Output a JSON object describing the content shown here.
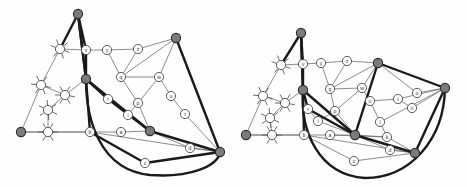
{
  "figure": {
    "title": "",
    "background": "#ffffff",
    "panel_count": 2,
    "colors": {
      "thin_edge": "#6e6e6e",
      "thick_edge": "#1a1a1a",
      "node_fill": "#ffffff",
      "node_stroke": "#4a4a4a",
      "terminal_fill": "#7b7b7b",
      "terminal_stroke": "#2a2a2a",
      "label_color": "#3a3a3a",
      "star_stroke": "#5a5a5a"
    },
    "style": {
      "node_radius": 4.6,
      "terminal_radius": 4.6,
      "thin_edge_width": 0.8,
      "thick_edge_width": 2.4,
      "star_spoke_length": 5.0,
      "label_font_size": 5.2
    }
  },
  "panels": [
    {
      "name": "left-embedding",
      "label": "",
      "nodes": [
        {
          "id": "T1",
          "label": "",
          "x": 78,
          "y": 14,
          "type": "terminal"
        },
        {
          "id": "T2",
          "label": "",
          "x": 176,
          "y": 38,
          "type": "terminal"
        },
        {
          "id": "T3",
          "label": "",
          "x": 86,
          "y": 79,
          "type": "terminal"
        },
        {
          "id": "T4",
          "label": "",
          "x": 21,
          "y": 132,
          "type": "terminal"
        },
        {
          "id": "T5",
          "label": "",
          "x": 150,
          "y": 131,
          "type": "terminal"
        },
        {
          "id": "T6",
          "label": "",
          "x": 220,
          "y": 152,
          "type": "terminal"
        },
        {
          "id": "s1",
          "label": "",
          "x": 60,
          "y": 49,
          "type": "star",
          "spokes": [
            20,
            70,
            130,
            200,
            250,
            320
          ]
        },
        {
          "id": "s2",
          "label": "",
          "x": 41,
          "y": 85,
          "type": "star",
          "spokes": [
            15,
            65,
            125,
            185,
            245,
            305
          ]
        },
        {
          "id": "s3",
          "label": "",
          "x": 65,
          "y": 95,
          "type": "star",
          "spokes": [
            10,
            60,
            120,
            180,
            240,
            300
          ]
        },
        {
          "id": "s4",
          "label": "",
          "x": 48,
          "y": 110,
          "type": "star",
          "spokes": [
            25,
            85,
            145,
            205,
            265,
            325
          ]
        },
        {
          "id": "s5",
          "label": "",
          "x": 48,
          "y": 132,
          "type": "star",
          "spokes": [
            0,
            60,
            120,
            180,
            240,
            300
          ]
        },
        {
          "id": "v",
          "label": "v",
          "x": 86,
          "y": 50,
          "type": "node"
        },
        {
          "id": "y",
          "label": "y",
          "x": 107,
          "y": 50,
          "type": "node"
        },
        {
          "id": "z",
          "label": "z",
          "x": 138,
          "y": 49,
          "type": "node"
        },
        {
          "id": "q",
          "label": "q",
          "x": 121,
          "y": 77,
          "type": "node"
        },
        {
          "id": "w",
          "label": "w",
          "x": 159,
          "y": 77,
          "type": "node"
        },
        {
          "id": "u",
          "label": "u",
          "x": 171,
          "y": 96,
          "type": "node"
        },
        {
          "id": "t",
          "label": "t",
          "x": 185,
          "y": 114,
          "type": "node"
        },
        {
          "id": "r",
          "label": "r",
          "x": 108,
          "y": 99,
          "type": "node"
        },
        {
          "id": "p",
          "label": "p",
          "x": 138,
          "y": 103,
          "type": "node"
        },
        {
          "id": "i",
          "label": "i",
          "x": 128,
          "y": 115,
          "type": "node"
        },
        {
          "id": "b",
          "label": "b",
          "x": 90,
          "y": 132,
          "type": "node"
        },
        {
          "id": "a",
          "label": "a",
          "x": 121,
          "y": 132,
          "type": "node"
        },
        {
          "id": "d",
          "label": "d",
          "x": 190,
          "y": 148,
          "type": "node"
        },
        {
          "id": "c",
          "label": "c",
          "x": 145,
          "y": 163,
          "type": "node"
        }
      ],
      "thin_edges": [
        [
          "T1",
          "s1"
        ],
        [
          "T1",
          "v"
        ],
        [
          "s1",
          "v"
        ],
        [
          "v",
          "y"
        ],
        [
          "y",
          "z"
        ],
        [
          "z",
          "T2"
        ],
        [
          "y",
          "q"
        ],
        [
          "z",
          "q"
        ],
        [
          "q",
          "T2"
        ],
        [
          "T2",
          "w"
        ],
        [
          "w",
          "u"
        ],
        [
          "u",
          "t"
        ],
        [
          "q",
          "w"
        ],
        [
          "q",
          "p"
        ],
        [
          "p",
          "w"
        ],
        [
          "s1",
          "s2"
        ],
        [
          "s2",
          "s3"
        ],
        [
          "s3",
          "T3"
        ],
        [
          "s2",
          "T4"
        ],
        [
          "s3",
          "s4"
        ],
        [
          "s4",
          "s5"
        ],
        [
          "s5",
          "T4"
        ],
        [
          "s5",
          "b"
        ],
        [
          "T3",
          "r"
        ],
        [
          "r",
          "i"
        ],
        [
          "i",
          "p"
        ],
        [
          "i",
          "T5"
        ],
        [
          "p",
          "T5"
        ],
        [
          "b",
          "a"
        ],
        [
          "a",
          "T5"
        ],
        [
          "T5",
          "d"
        ],
        [
          "d",
          "T6"
        ],
        [
          "T5",
          "T6"
        ],
        [
          "b",
          "c"
        ],
        [
          "c",
          "T6"
        ],
        [
          "b",
          "T6"
        ],
        [
          "t",
          "T6"
        ],
        [
          "T4",
          "b"
        ]
      ],
      "thick_edges": [
        [
          "T1",
          "v"
        ],
        [
          "T1",
          "s1"
        ],
        [
          "v",
          "T3"
        ],
        [
          "T2",
          "T6"
        ],
        [
          "T3",
          "r"
        ],
        [
          "r",
          "T5"
        ],
        [
          "T3",
          "b"
        ],
        [
          "b",
          "c"
        ],
        [
          "c",
          "T6"
        ],
        [
          "T5",
          "T6"
        ],
        [
          "T3",
          "T1"
        ]
      ],
      "thick_arc": {
        "from": "T3",
        "to": "T6",
        "path": "M 86 79 C 86 120 100 170 150 175 C 190 178 218 166 220 152"
      },
      "spine": [
        [
          "T1",
          "T3"
        ],
        [
          "T3",
          "T5"
        ]
      ]
    },
    {
      "name": "right-embedding",
      "label": "",
      "nodes": [
        {
          "id": "T1",
          "label": "",
          "x": 301,
          "y": 33,
          "type": "terminal"
        },
        {
          "id": "T2",
          "label": "",
          "x": 378,
          "y": 63,
          "type": "terminal"
        },
        {
          "id": "T3",
          "label": "",
          "x": 303,
          "y": 90,
          "type": "terminal"
        },
        {
          "id": "T4",
          "label": "",
          "x": 246,
          "y": 135,
          "type": "terminal"
        },
        {
          "id": "T5",
          "label": "",
          "x": 355,
          "y": 135,
          "type": "terminal"
        },
        {
          "id": "T6",
          "label": "",
          "x": 445,
          "y": 88,
          "type": "terminal"
        },
        {
          "id": "T7",
          "label": "",
          "x": 415,
          "y": 153,
          "type": "terminal"
        },
        {
          "id": "s1",
          "label": "",
          "x": 281,
          "y": 65,
          "type": "star",
          "spokes": [
            20,
            70,
            130,
            200,
            250,
            320
          ]
        },
        {
          "id": "s2",
          "label": "",
          "x": 263,
          "y": 96,
          "type": "star",
          "spokes": [
            15,
            65,
            125,
            185,
            245,
            305
          ]
        },
        {
          "id": "s3",
          "label": "",
          "x": 285,
          "y": 103,
          "type": "star",
          "spokes": [
            10,
            60,
            120,
            180,
            240,
            300
          ]
        },
        {
          "id": "s4",
          "label": "",
          "x": 270,
          "y": 118,
          "type": "star",
          "spokes": [
            25,
            85,
            145,
            205,
            265,
            325
          ]
        },
        {
          "id": "s5",
          "label": "",
          "x": 272,
          "y": 135,
          "type": "star",
          "spokes": [
            0,
            60,
            120,
            180,
            240,
            300
          ]
        },
        {
          "id": "v",
          "label": "v",
          "x": 303,
          "y": 64,
          "type": "node"
        },
        {
          "id": "y",
          "label": "y",
          "x": 321,
          "y": 63,
          "type": "node"
        },
        {
          "id": "z",
          "label": "z",
          "x": 347,
          "y": 61,
          "type": "node"
        },
        {
          "id": "q",
          "label": "q",
          "x": 330,
          "y": 89,
          "type": "node"
        },
        {
          "id": "w",
          "label": "w",
          "x": 362,
          "y": 88,
          "type": "node"
        },
        {
          "id": "u",
          "label": "u",
          "x": 370,
          "y": 101,
          "type": "node"
        },
        {
          "id": "t",
          "label": "t",
          "x": 398,
          "y": 99,
          "type": "node"
        },
        {
          "id": "o",
          "label": "o",
          "x": 417,
          "y": 93,
          "type": "node"
        },
        {
          "id": "n",
          "label": "n",
          "x": 412,
          "y": 108,
          "type": "node"
        },
        {
          "id": "r",
          "label": "r",
          "x": 308,
          "y": 109,
          "type": "node"
        },
        {
          "id": "p",
          "label": "p",
          "x": 335,
          "y": 111,
          "type": "node"
        },
        {
          "id": "i",
          "label": "i",
          "x": 318,
          "y": 121,
          "type": "node"
        },
        {
          "id": "l",
          "label": "l",
          "x": 380,
          "y": 122,
          "type": "node"
        },
        {
          "id": "k",
          "label": "k",
          "x": 387,
          "y": 137,
          "type": "node"
        },
        {
          "id": "b",
          "label": "b",
          "x": 304,
          "y": 135,
          "type": "node"
        },
        {
          "id": "a",
          "label": "a",
          "x": 330,
          "y": 135,
          "type": "node"
        },
        {
          "id": "d",
          "label": "d",
          "x": 390,
          "y": 150,
          "type": "node"
        },
        {
          "id": "c",
          "label": "c",
          "x": 354,
          "y": 161,
          "type": "node"
        }
      ],
      "thin_edges": [
        [
          "T1",
          "s1"
        ],
        [
          "T1",
          "v"
        ],
        [
          "s1",
          "v"
        ],
        [
          "v",
          "y"
        ],
        [
          "y",
          "z"
        ],
        [
          "z",
          "T2"
        ],
        [
          "y",
          "q"
        ],
        [
          "z",
          "q"
        ],
        [
          "q",
          "T2"
        ],
        [
          "T2",
          "w"
        ],
        [
          "w",
          "u"
        ],
        [
          "u",
          "t"
        ],
        [
          "q",
          "w"
        ],
        [
          "q",
          "p"
        ],
        [
          "p",
          "w"
        ],
        [
          "s1",
          "s2"
        ],
        [
          "s2",
          "s3"
        ],
        [
          "s3",
          "T3"
        ],
        [
          "s2",
          "T4"
        ],
        [
          "s3",
          "s4"
        ],
        [
          "s4",
          "s5"
        ],
        [
          "s5",
          "T4"
        ],
        [
          "s5",
          "b"
        ],
        [
          "T3",
          "r"
        ],
        [
          "r",
          "i"
        ],
        [
          "i",
          "p"
        ],
        [
          "i",
          "T5"
        ],
        [
          "p",
          "T5"
        ],
        [
          "b",
          "a"
        ],
        [
          "a",
          "T5"
        ],
        [
          "T5",
          "d"
        ],
        [
          "d",
          "T7"
        ],
        [
          "T5",
          "T7"
        ],
        [
          "b",
          "c"
        ],
        [
          "c",
          "T7"
        ],
        [
          "b",
          "T7"
        ],
        [
          "t",
          "T6"
        ],
        [
          "T4",
          "b"
        ],
        [
          "T2",
          "o"
        ],
        [
          "o",
          "T6"
        ],
        [
          "n",
          "T6"
        ],
        [
          "t",
          "n"
        ],
        [
          "l",
          "T6"
        ],
        [
          "l",
          "k"
        ],
        [
          "k",
          "T7"
        ],
        [
          "T5",
          "k"
        ],
        [
          "T6",
          "T7"
        ],
        [
          "u",
          "l"
        ],
        [
          "a",
          "k"
        ]
      ],
      "thick_edges": [
        [
          "T1",
          "v"
        ],
        [
          "T1",
          "s1"
        ],
        [
          "v",
          "T3"
        ],
        [
          "T2",
          "T6"
        ],
        [
          "T3",
          "r"
        ],
        [
          "r",
          "T5"
        ],
        [
          "T3",
          "b"
        ],
        [
          "T2",
          "T5"
        ],
        [
          "T5",
          "T7"
        ],
        [
          "T6",
          "T7"
        ],
        [
          "T3",
          "T1"
        ]
      ],
      "thick_arc": {
        "from": "T3",
        "to": "T6",
        "path": "M 303 90 C 300 130 318 175 365 178 C 410 178 444 140 445 88"
      },
      "spine": [
        [
          "T1",
          "T3"
        ],
        [
          "T3",
          "T5"
        ]
      ]
    }
  ]
}
